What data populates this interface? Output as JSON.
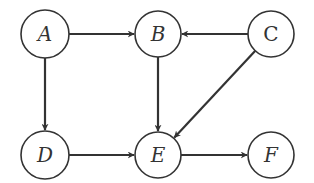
{
  "diagram": {
    "type": "directed-graph",
    "colors": {
      "stroke": "#333333",
      "background": "#ffffff"
    },
    "nodes": [
      {
        "id": "A",
        "label": "A",
        "x": 45,
        "y": 34,
        "r": 24
      },
      {
        "id": "B",
        "label": "B",
        "x": 158,
        "y": 34,
        "r": 23
      },
      {
        "id": "C",
        "label": "C",
        "x": 271,
        "y": 34,
        "r": 23
      },
      {
        "id": "D",
        "label": "D",
        "x": 45,
        "y": 155,
        "r": 24
      },
      {
        "id": "E",
        "label": "E",
        "x": 158,
        "y": 155,
        "r": 23
      },
      {
        "id": "F",
        "label": "F",
        "x": 271,
        "y": 155,
        "r": 23
      }
    ],
    "edges": [
      {
        "from": "A",
        "to": "B"
      },
      {
        "from": "C",
        "to": "B"
      },
      {
        "from": "A",
        "to": "D"
      },
      {
        "from": "B",
        "to": "E"
      },
      {
        "from": "C",
        "to": "E"
      },
      {
        "from": "D",
        "to": "E"
      },
      {
        "from": "E",
        "to": "F"
      }
    ]
  }
}
